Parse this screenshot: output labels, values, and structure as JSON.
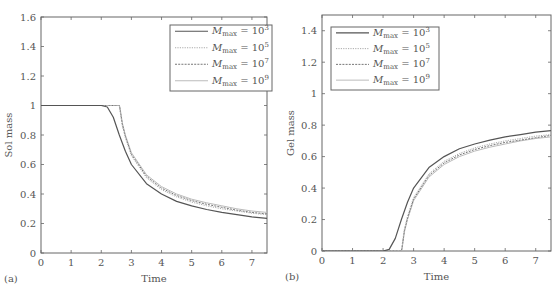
{
  "figure": {
    "panels": [
      {
        "id": "a",
        "label": "(a)",
        "xlabel": "Time",
        "ylabel": "Sol mass"
      },
      {
        "id": "b",
        "label": "(b)",
        "xlabel": "Time",
        "ylabel": "Gel mass"
      }
    ]
  },
  "chart_data": [
    {
      "type": "line",
      "panel_label": "(a)",
      "title": "",
      "xlabel": "Time",
      "ylabel": "Sol mass",
      "xlim": [
        0,
        7.5
      ],
      "ylim": [
        0,
        1.6
      ],
      "xticks": [
        0,
        1,
        2,
        3,
        4,
        5,
        6,
        7
      ],
      "yticks": [
        0,
        0.2,
        0.4,
        0.6,
        0.8,
        1,
        1.2,
        1.4,
        1.6
      ],
      "ytick_labels": [
        "0",
        "0.2",
        "0.4",
        "0.6",
        "0.8",
        "1",
        "1.2",
        "1.4",
        "1.6"
      ],
      "grid": false,
      "legend_position": "upper right",
      "legend": [
        "M_max = 10^3",
        "M_max = 10^5",
        "M_max = 10^7",
        "M_max = 10^9"
      ],
      "series": [
        {
          "name": "M_max = 10^3",
          "style": "solid",
          "color": "#555555",
          "x": [
            0,
            2.0,
            2.2,
            2.4,
            2.6,
            2.8,
            3.0,
            3.5,
            4.0,
            4.5,
            5.0,
            5.5,
            6.0,
            6.5,
            7.0,
            7.5
          ],
          "y": [
            1.0,
            1.0,
            0.99,
            0.92,
            0.8,
            0.69,
            0.6,
            0.47,
            0.4,
            0.35,
            0.32,
            0.295,
            0.275,
            0.26,
            0.245,
            0.235
          ]
        },
        {
          "name": "M_max = 10^5",
          "style": "dotted",
          "color": "#aaaaaa",
          "x": [
            0,
            2.6,
            2.62,
            2.7,
            2.8,
            3.0,
            3.5,
            4.0,
            4.5,
            5.0,
            5.5,
            6.0,
            6.5,
            7.0,
            7.5
          ],
          "y": [
            1.0,
            1.0,
            0.97,
            0.86,
            0.78,
            0.66,
            0.51,
            0.43,
            0.38,
            0.345,
            0.32,
            0.3,
            0.285,
            0.27,
            0.26
          ]
        },
        {
          "name": "M_max = 10^7",
          "style": "dashed-fine",
          "color": "#777777",
          "x": [
            0,
            2.6,
            2.62,
            2.7,
            2.8,
            3.0,
            3.5,
            4.0,
            4.5,
            5.0,
            5.5,
            6.0,
            6.5,
            7.0,
            7.5
          ],
          "y": [
            1.0,
            1.0,
            0.98,
            0.87,
            0.79,
            0.67,
            0.52,
            0.44,
            0.39,
            0.355,
            0.33,
            0.31,
            0.29,
            0.275,
            0.265
          ]
        },
        {
          "name": "M_max = 10^9",
          "style": "solid-light",
          "color": "#bbbbbb",
          "x": [
            0,
            2.6,
            2.62,
            2.7,
            2.8,
            3.0,
            3.5,
            4.0,
            4.5,
            5.0,
            5.5,
            6.0,
            6.5,
            7.0,
            7.5
          ],
          "y": [
            1.0,
            1.0,
            0.99,
            0.88,
            0.8,
            0.68,
            0.53,
            0.45,
            0.4,
            0.365,
            0.34,
            0.32,
            0.3,
            0.285,
            0.275
          ]
        }
      ]
    },
    {
      "type": "line",
      "panel_label": "(b)",
      "title": "",
      "xlabel": "Time",
      "ylabel": "Gel mass",
      "xlim": [
        0,
        7.5
      ],
      "ylim": [
        0,
        1.5
      ],
      "xticks": [
        0,
        1,
        2,
        3,
        4,
        5,
        6,
        7
      ],
      "yticks": [
        0,
        0.2,
        0.4,
        0.6,
        0.8,
        1,
        1.2,
        1.4
      ],
      "ytick_labels": [
        "0",
        "0.2",
        "0.4",
        "0.6",
        "0.8",
        "1",
        "1.2",
        "1.4"
      ],
      "grid": false,
      "legend_position": "upper left",
      "legend": [
        "M_max = 10^3",
        "M_max = 10^5",
        "M_max = 10^7",
        "M_max = 10^9"
      ],
      "series": [
        {
          "name": "M_max = 10^3",
          "style": "solid",
          "color": "#555555",
          "x": [
            0,
            2.0,
            2.2,
            2.4,
            2.6,
            2.8,
            3.0,
            3.5,
            4.0,
            4.5,
            5.0,
            5.5,
            6.0,
            6.5,
            7.0,
            7.5
          ],
          "y": [
            0,
            0,
            0.01,
            0.08,
            0.2,
            0.31,
            0.4,
            0.53,
            0.6,
            0.65,
            0.68,
            0.705,
            0.725,
            0.74,
            0.755,
            0.765
          ]
        },
        {
          "name": "M_max = 10^5",
          "style": "dotted",
          "color": "#aaaaaa",
          "x": [
            0,
            2.6,
            2.62,
            2.7,
            2.8,
            3.0,
            3.5,
            4.0,
            4.5,
            5.0,
            5.5,
            6.0,
            6.5,
            7.0,
            7.5
          ],
          "y": [
            0,
            0,
            0.03,
            0.14,
            0.22,
            0.34,
            0.49,
            0.57,
            0.62,
            0.655,
            0.68,
            0.7,
            0.715,
            0.73,
            0.74
          ]
        },
        {
          "name": "M_max = 10^7",
          "style": "dashed-fine",
          "color": "#777777",
          "x": [
            0,
            2.6,
            2.62,
            2.7,
            2.8,
            3.0,
            3.5,
            4.0,
            4.5,
            5.0,
            5.5,
            6.0,
            6.5,
            7.0,
            7.5
          ],
          "y": [
            0,
            0,
            0.02,
            0.13,
            0.21,
            0.33,
            0.48,
            0.56,
            0.61,
            0.645,
            0.67,
            0.69,
            0.705,
            0.72,
            0.735
          ]
        },
        {
          "name": "M_max = 10^9",
          "style": "solid-light",
          "color": "#bbbbbb",
          "x": [
            0,
            2.6,
            2.62,
            2.7,
            2.8,
            3.0,
            3.5,
            4.0,
            4.5,
            5.0,
            5.5,
            6.0,
            6.5,
            7.0,
            7.5
          ],
          "y": [
            0,
            0,
            0.01,
            0.12,
            0.2,
            0.32,
            0.47,
            0.55,
            0.6,
            0.635,
            0.66,
            0.68,
            0.7,
            0.715,
            0.725
          ]
        }
      ]
    }
  ],
  "legend_entries": [
    {
      "symbol": "M",
      "sub": "max",
      "eq": " = 10",
      "sup": "3"
    },
    {
      "symbol": "M",
      "sub": "max",
      "eq": " = 10",
      "sup": "5"
    },
    {
      "symbol": "M",
      "sub": "max",
      "eq": " = 10",
      "sup": "7"
    },
    {
      "symbol": "M",
      "sub": "max",
      "eq": " = 10",
      "sup": "9"
    }
  ],
  "colors": {
    "axis": "#666666",
    "text": "#555555",
    "background": "#ffffff"
  }
}
